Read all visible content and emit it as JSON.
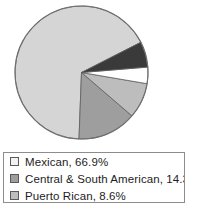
{
  "chart_data": {
    "type": "pie",
    "title": "",
    "legend_position": "bottom",
    "grid": false,
    "start_angle_deg": -27,
    "direction": "counterclockwise",
    "categories": [
      "Mexican",
      "Central & South American",
      "Puerto Rican",
      "Cuban",
      "Other Hispanic"
    ],
    "values": [
      66.9,
      14.3,
      8.6,
      4.0,
      6.2
    ],
    "labels": [
      "66.9%",
      "14.3%",
      "8.6%",
      "",
      ""
    ],
    "colors": [
      "#d5d5d5",
      "#9e9e9e",
      "#bdbdbd",
      "#ffffff",
      "#3a3a3a"
    ],
    "slices": [
      {
        "name": "Mexican",
        "value": 66.9,
        "label": "66.9%",
        "color": "#d5d5d5",
        "swatch": "#f2f2f2"
      },
      {
        "name": "Central & South American",
        "value": 14.3,
        "label": "14.3%",
        "color": "#9e9e9e",
        "swatch": "#9e9e9e"
      },
      {
        "name": "Puerto Rican",
        "value": 8.6,
        "label": "8.6%",
        "color": "#bdbdbd",
        "swatch": "#bdbdbd"
      },
      {
        "name": "Cuban",
        "value": 4.0,
        "label": "",
        "color": "#ffffff",
        "swatch": "#ffffff"
      },
      {
        "name": "Other Hispanic",
        "value": 6.2,
        "label": "",
        "color": "#3a3a3a",
        "swatch": "#3a3a3a"
      }
    ]
  },
  "pie": {
    "outline_color": "#6f6f6f",
    "geometry": {
      "center_x": 69.5,
      "center_y": 69.5,
      "radius": 66.5
    }
  },
  "legend": {
    "border_color": "#8d8d8d",
    "background": "#ffffff",
    "items": [
      {
        "label": "Mexican, 66.9%",
        "swatch": "#f2f2f2"
      },
      {
        "label": "Central & South American, 14.3%",
        "swatch": "#9e9e9e"
      },
      {
        "label": "Puerto Rican, 8.6%",
        "swatch": "#bdbdbd"
      }
    ]
  }
}
